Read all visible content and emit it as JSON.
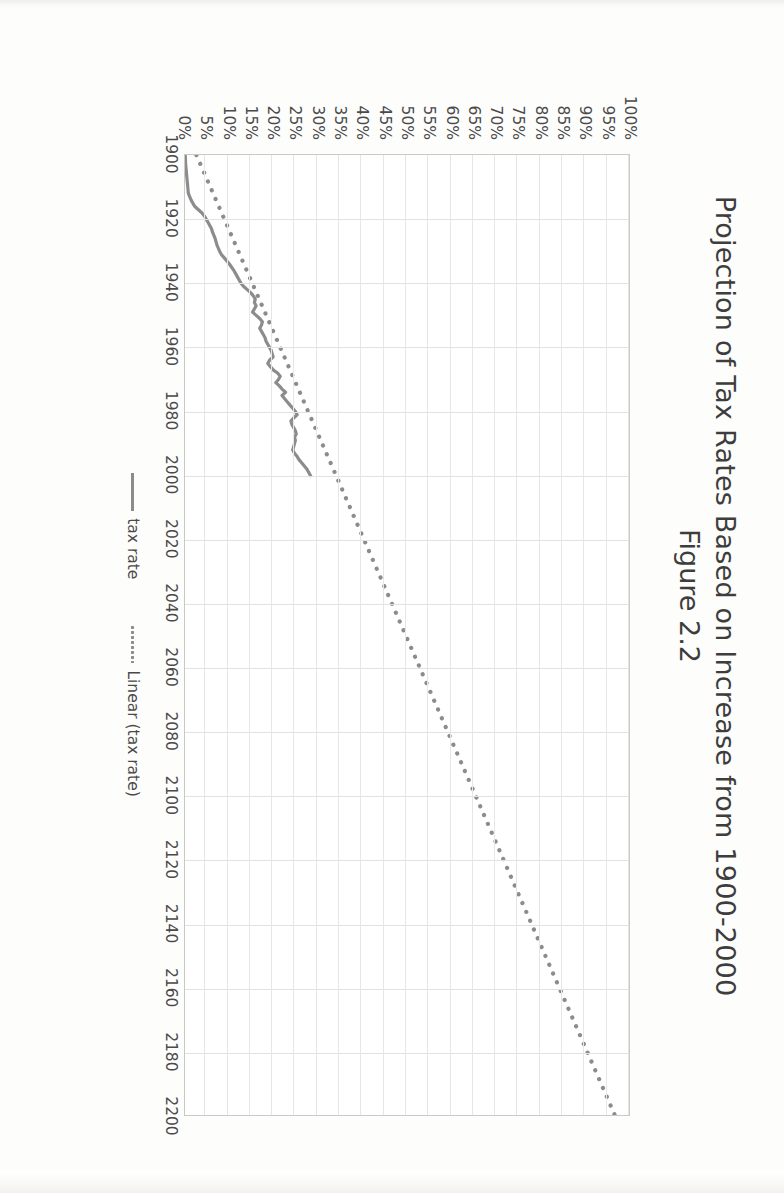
{
  "chart_data": {
    "type": "line",
    "title": "Projection of Tax Rates Based on Increase from 1900-2000",
    "subtitle": "Figure 2.2",
    "xlabel": "",
    "ylabel": "",
    "xlim": [
      1900,
      2200
    ],
    "ylim": [
      0,
      1.0
    ],
    "grid": true,
    "legend_position": "bottom",
    "x_ticks": [
      "1900",
      "1920",
      "1940",
      "1960",
      "1980",
      "2000",
      "2020",
      "2040",
      "2060",
      "2080",
      "2100",
      "2120",
      "2140",
      "2160",
      "2180",
      "2200"
    ],
    "y_ticks": [
      "0%",
      "5%",
      "10%",
      "15%",
      "20%",
      "25%",
      "30%",
      "35%",
      "40%",
      "45%",
      "50%",
      "55%",
      "60%",
      "65%",
      "70%",
      "75%",
      "80%",
      "85%",
      "90%",
      "95%",
      "100%"
    ],
    "series": [
      {
        "name": "tax rate",
        "style": "solid",
        "color": "#8c8c8c",
        "x": [
          1900,
          1903,
          1906,
          1909,
          1912,
          1913,
          1914,
          1915,
          1916,
          1917,
          1918,
          1919,
          1920,
          1921,
          1922,
          1923,
          1924,
          1925,
          1926,
          1927,
          1928,
          1929,
          1930,
          1931,
          1932,
          1933,
          1934,
          1935,
          1936,
          1937,
          1938,
          1939,
          1940,
          1941,
          1942,
          1943,
          1944,
          1945,
          1946,
          1947,
          1948,
          1949,
          1950,
          1951,
          1952,
          1953,
          1954,
          1955,
          1956,
          1957,
          1958,
          1959,
          1960,
          1961,
          1962,
          1963,
          1964,
          1965,
          1966,
          1967,
          1968,
          1969,
          1970,
          1971,
          1972,
          1973,
          1974,
          1975,
          1976,
          1977,
          1978,
          1979,
          1980,
          1981,
          1982,
          1983,
          1984,
          1985,
          1986,
          1987,
          1988,
          1989,
          1990,
          1991,
          1992,
          1993,
          1994,
          1995,
          1996,
          1997,
          1998,
          1999,
          2000
        ],
        "y": [
          0.5,
          0.6,
          0.8,
          1.0,
          1.2,
          1.5,
          1.8,
          2.2,
          2.6,
          3.4,
          4.2,
          4.8,
          5.2,
          5.6,
          6.0,
          6.4,
          6.6,
          6.9,
          7.2,
          7.4,
          7.6,
          7.9,
          8.2,
          8.6,
          9.2,
          9.8,
          10.4,
          10.9,
          11.4,
          11.8,
          12.2,
          12.6,
          13.0,
          13.6,
          14.4,
          15.2,
          15.8,
          16.2,
          16.0,
          16.4,
          16.0,
          15.6,
          16.4,
          17.2,
          17.8,
          17.6,
          17.2,
          17.6,
          18.0,
          18.4,
          18.6,
          19.0,
          19.4,
          19.8,
          20.0,
          20.2,
          19.4,
          19.0,
          19.6,
          20.2,
          21.2,
          21.8,
          21.4,
          20.8,
          21.6,
          22.2,
          23.0,
          22.2,
          22.8,
          23.4,
          24.0,
          24.6,
          25.2,
          25.6,
          24.8,
          24.2,
          24.4,
          24.8,
          25.2,
          25.4,
          25.0,
          25.2,
          25.0,
          24.8,
          24.6,
          25.0,
          25.6,
          26.0,
          26.6,
          27.2,
          27.8,
          28.2,
          28.6
        ]
      },
      {
        "name": "Linear (tax rate)",
        "style": "dotted",
        "color": "#8c8c8c",
        "x": [
          1900,
          2200
        ],
        "y": [
          3.0,
          97.0
        ],
        "note": "linear trendline extrapolated to 2200"
      }
    ]
  },
  "legend": {
    "items": [
      {
        "label": "tax rate",
        "marker": "solid-line-swatch"
      },
      {
        "label": "Linear (tax rate)",
        "marker": "dotted-line-swatch"
      }
    ]
  },
  "colors": {
    "series": "#8c8c8c",
    "gridline": "#e2e2e2",
    "plot_border": "#c9c9c9",
    "text": "#3d3d3d",
    "tick_text": "#4a4a4a",
    "page_background": "#fdfdfc"
  }
}
